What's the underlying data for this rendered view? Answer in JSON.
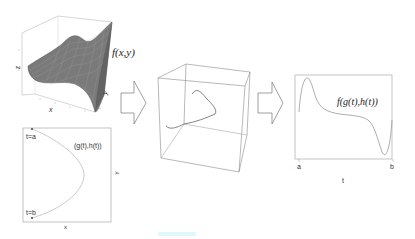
{
  "surface_plot": {
    "function_label": "f(x,y)",
    "axis_x": "x",
    "axis_y": "y",
    "axis_z": "z"
  },
  "path_plot": {
    "curve_label": "(g(t),h(t))",
    "start_label": "t=a",
    "end_label": "t=b",
    "axis_x": "x",
    "axis_y": "y"
  },
  "arrows": [
    {
      "direction": "right"
    },
    {
      "direction": "right"
    }
  ],
  "cube_plot": {
    "description": "3D box containing curve lying on surface"
  },
  "line_plot": {
    "curve_label": "f(g(t),h(t))",
    "tick_start": "a",
    "tick_end": "b",
    "axis_x": "t"
  },
  "colors": {
    "line": "#888888",
    "box": "#aaaaaa",
    "surface": "#6f6f6f",
    "artifact": "#dff8fb"
  }
}
